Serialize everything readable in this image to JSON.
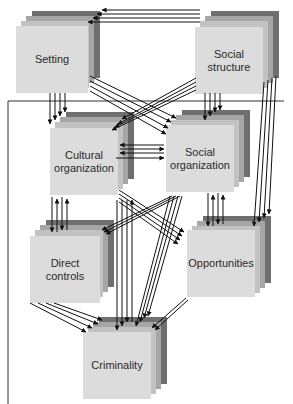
{
  "diagram": {
    "type": "causal-flow",
    "nodes": [
      {
        "id": "setting",
        "label": "Setting"
      },
      {
        "id": "social_structure",
        "label": "Social\nstructure"
      },
      {
        "id": "cultural_organization",
        "label": "Cultural\norganization"
      },
      {
        "id": "social_organization",
        "label": "Social\norganization"
      },
      {
        "id": "direct_controls",
        "label": "Direct\ncontrols"
      },
      {
        "id": "opportunities",
        "label": "Opportunities"
      },
      {
        "id": "criminality",
        "label": "Criminality"
      }
    ],
    "colors": {
      "front_face": "#dcdcdc",
      "layer_light": "#c2c2c2",
      "layer_mid": "#a6a6a6",
      "layer_dark": "#6f6f6f",
      "arrows": "#111111",
      "text": "#2a2a2a"
    },
    "frame": {
      "description": "Bracket line separating top row (Setting, Social structure) from lower nodes"
    }
  }
}
